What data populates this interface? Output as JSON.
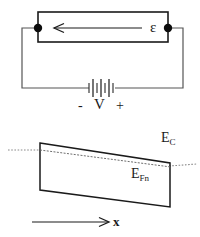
{
  "figure": {
    "width": 200,
    "height": 237,
    "background_color": "#ffffff",
    "line_color": "#1a1a1a",
    "dotted_color": "#999999"
  },
  "circuit": {
    "emf_label": "ε",
    "battery_label": "V",
    "minus_sign": "-",
    "plus_sign": "+",
    "current_arrow_direction": "left",
    "sample_rect": {
      "x": 38,
      "y": 12,
      "width": 130,
      "height": 30
    },
    "contact_nodes": [
      {
        "name": "left-contact",
        "cx": 38,
        "cy": 28,
        "r": 4
      },
      {
        "name": "right-contact",
        "cx": 168,
        "cy": 28,
        "r": 4
      }
    ],
    "battery_cells": 4
  },
  "band_diagram": {
    "ec_label": "E",
    "ec_sub": "C",
    "efn_label": "E",
    "efn_sub": "Fn",
    "axis_label": "x",
    "band_polygon": "40,143 170,163 170,207 40,190",
    "ec_slope_line": {
      "x1": 40,
      "y1": 150,
      "x2": 172,
      "y2": 168
    },
    "left_dotted": {
      "x1": 8,
      "y1": 150,
      "x2": 40,
      "y2": 150
    },
    "right_dotted": {
      "x1": 170,
      "y1": 166,
      "x2": 196,
      "y2": 164
    },
    "x_axis_arrow": {
      "x1": 32,
      "y1": 222,
      "x2": 110,
      "y2": 222
    }
  }
}
